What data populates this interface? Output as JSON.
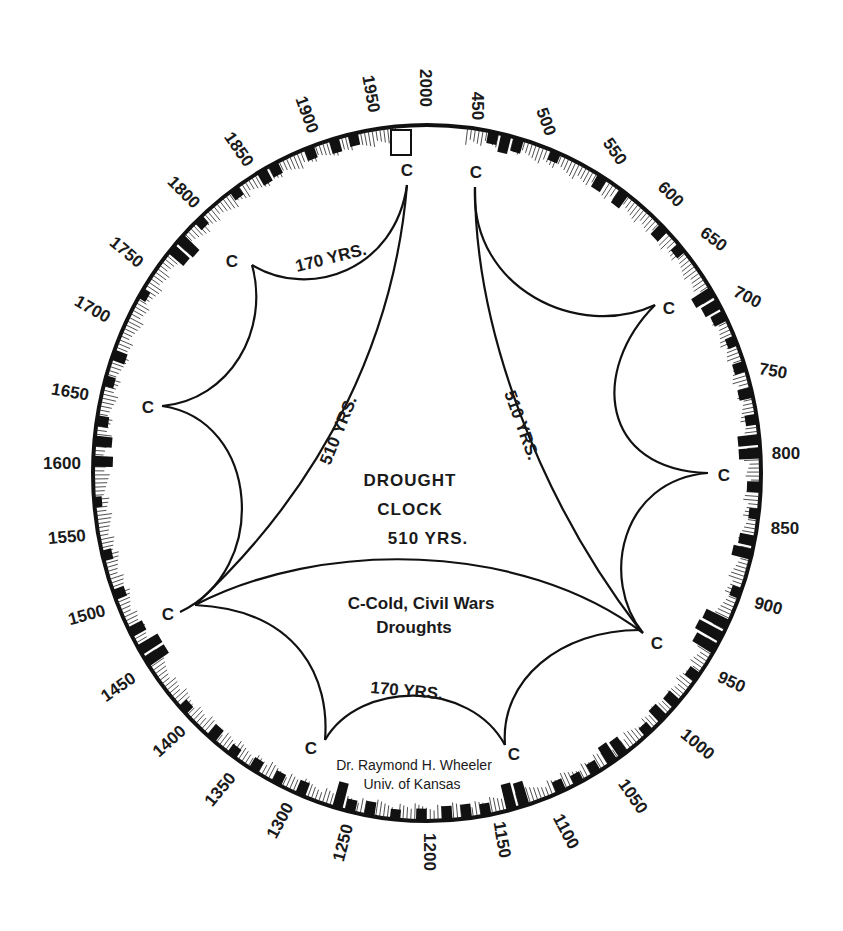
{
  "title": {
    "line1": "DROUGHT",
    "line2": "CLOCK",
    "line3": "510 YRS."
  },
  "legend": {
    "line1": "C-Cold, Civil Wars",
    "line2": "Droughts"
  },
  "credit": {
    "line1": "Dr. Raymond H. Wheeler",
    "line2": "Univ. of Kansas"
  },
  "cycle_labels": {
    "top_left_170": "170 YRS.",
    "bottom_170": "170 YRS.",
    "left_510": "510 YRS.",
    "right_510": "510 YRS."
  },
  "cusp_marker": "C",
  "cusps": [
    {
      "id": "c-top-left",
      "x": 407,
      "y": 185,
      "lx": 407,
      "ly": 172
    },
    {
      "id": "c-top-right",
      "x": 475,
      "y": 187,
      "lx": 476,
      "ly": 174
    },
    {
      "id": "c-upper-left",
      "x": 252,
      "y": 265,
      "lx": 232,
      "ly": 263
    },
    {
      "id": "c-left",
      "x": 162,
      "y": 406,
      "lx": 148,
      "ly": 409
    },
    {
      "id": "c-lower-left",
      "x": 180,
      "y": 612,
      "lx": 168,
      "ly": 616
    },
    {
      "id": "c-bottom-left",
      "x": 325,
      "y": 740,
      "lx": 311,
      "ly": 750
    },
    {
      "id": "c-bottom-right",
      "x": 505,
      "y": 745,
      "lx": 514,
      "ly": 756
    },
    {
      "id": "c-lower-right",
      "x": 643,
      "y": 633,
      "lx": 657,
      "ly": 645
    },
    {
      "id": "c-right",
      "x": 708,
      "y": 473,
      "lx": 724,
      "ly": 477
    },
    {
      "id": "c-upper-right",
      "x": 655,
      "y": 305,
      "lx": 669,
      "ly": 310
    }
  ],
  "ring": {
    "center_x": 427,
    "center_y": 473,
    "radius_x": 334,
    "radius_y": 348,
    "start_year_at_top_right": 450,
    "end_year_at_top_left": 2000,
    "gap_marker_year_range": [
      1985,
      2000
    ]
  },
  "year_ticks": [
    {
      "label": "450",
      "x": 476,
      "y": 106,
      "rot": 90
    },
    {
      "label": "500",
      "x": 545,
      "y": 122,
      "rot": 70
    },
    {
      "label": "550",
      "x": 614,
      "y": 152,
      "rot": 55
    },
    {
      "label": "600",
      "x": 670,
      "y": 195,
      "rot": 45
    },
    {
      "label": "650",
      "x": 713,
      "y": 240,
      "rot": 37
    },
    {
      "label": "700",
      "x": 747,
      "y": 298,
      "rot": 27
    },
    {
      "label": "750",
      "x": 773,
      "y": 372,
      "rot": 10
    },
    {
      "label": "800",
      "x": 786,
      "y": 455,
      "rot": 0
    },
    {
      "label": "850",
      "x": 785,
      "y": 530,
      "rot": 0
    },
    {
      "label": "900",
      "x": 768,
      "y": 607,
      "rot": 15
    },
    {
      "label": "950",
      "x": 731,
      "y": 683,
      "rot": 25
    },
    {
      "label": "1000",
      "x": 697,
      "y": 745,
      "rot": 40
    },
    {
      "label": "1050",
      "x": 632,
      "y": 797,
      "rot": 55
    },
    {
      "label": "1100",
      "x": 565,
      "y": 832,
      "rot": 62
    },
    {
      "label": "1150",
      "x": 501,
      "y": 840,
      "rot": 80
    },
    {
      "label": "1200",
      "x": 428,
      "y": 852,
      "rot": 90
    },
    {
      "label": "1250",
      "x": 344,
      "y": 843,
      "rot": -75
    },
    {
      "label": "1300",
      "x": 281,
      "y": 821,
      "rot": -62
    },
    {
      "label": "1350",
      "x": 221,
      "y": 790,
      "rot": -50
    },
    {
      "label": "1400",
      "x": 170,
      "y": 742,
      "rot": -42
    },
    {
      "label": "1450",
      "x": 119,
      "y": 688,
      "rot": -35
    },
    {
      "label": "1500",
      "x": 87,
      "y": 616,
      "rot": -15
    },
    {
      "label": "1550",
      "x": 67,
      "y": 538,
      "rot": -5
    },
    {
      "label": "1600",
      "x": 62,
      "y": 465,
      "rot": 0
    },
    {
      "label": "1650",
      "x": 70,
      "y": 393,
      "rot": 10
    },
    {
      "label": "1700",
      "x": 92,
      "y": 310,
      "rot": 30
    },
    {
      "label": "1750",
      "x": 126,
      "y": 253,
      "rot": 40
    },
    {
      "label": "1800",
      "x": 183,
      "y": 193,
      "rot": 45
    },
    {
      "label": "1850",
      "x": 238,
      "y": 150,
      "rot": 55
    },
    {
      "label": "1900",
      "x": 306,
      "y": 115,
      "rot": 70
    },
    {
      "label": "1950",
      "x": 370,
      "y": 94,
      "rot": 80
    },
    {
      "label": "2000",
      "x": 424,
      "y": 88,
      "rot": 90
    }
  ],
  "drought_bars": [
    {
      "year": 470,
      "h": 12
    },
    {
      "year": 480,
      "h": 18
    },
    {
      "year": 490,
      "h": 14
    },
    {
      "year": 520,
      "h": 10
    },
    {
      "year": 560,
      "h": 14
    },
    {
      "year": 580,
      "h": 16
    },
    {
      "year": 620,
      "h": 14
    },
    {
      "year": 640,
      "h": 10
    },
    {
      "year": 680,
      "h": 22
    },
    {
      "year": 690,
      "h": 18
    },
    {
      "year": 700,
      "h": 14
    },
    {
      "year": 720,
      "h": 10
    },
    {
      "year": 740,
      "h": 12
    },
    {
      "year": 760,
      "h": 14
    },
    {
      "year": 780,
      "h": 12
    },
    {
      "year": 795,
      "h": 22
    },
    {
      "year": 805,
      "h": 22
    },
    {
      "year": 830,
      "h": 14
    },
    {
      "year": 850,
      "h": 10
    },
    {
      "year": 870,
      "h": 16
    },
    {
      "year": 880,
      "h": 20
    },
    {
      "year": 910,
      "h": 10
    },
    {
      "year": 935,
      "h": 26
    },
    {
      "year": 945,
      "h": 28
    },
    {
      "year": 955,
      "h": 24
    },
    {
      "year": 980,
      "h": 12
    },
    {
      "year": 1005,
      "h": 14
    },
    {
      "year": 1020,
      "h": 16
    },
    {
      "year": 1035,
      "h": 10
    },
    {
      "year": 1060,
      "h": 18
    },
    {
      "year": 1070,
      "h": 20
    },
    {
      "year": 1085,
      "h": 12
    },
    {
      "year": 1100,
      "h": 10
    },
    {
      "year": 1115,
      "h": 12
    },
    {
      "year": 1145,
      "h": 24
    },
    {
      "year": 1155,
      "h": 26
    },
    {
      "year": 1175,
      "h": 12
    },
    {
      "year": 1190,
      "h": 14
    },
    {
      "year": 1205,
      "h": 14
    },
    {
      "year": 1225,
      "h": 12
    },
    {
      "year": 1245,
      "h": 10
    },
    {
      "year": 1265,
      "h": 14
    },
    {
      "year": 1280,
      "h": 12
    },
    {
      "year": 1290,
      "h": 26
    },
    {
      "year": 1320,
      "h": 14
    },
    {
      "year": 1340,
      "h": 12
    },
    {
      "year": 1360,
      "h": 12
    },
    {
      "year": 1380,
      "h": 10
    },
    {
      "year": 1400,
      "h": 14
    },
    {
      "year": 1430,
      "h": 10
    },
    {
      "year": 1475,
      "h": 24
    },
    {
      "year": 1485,
      "h": 24
    },
    {
      "year": 1500,
      "h": 16
    },
    {
      "year": 1530,
      "h": 12
    },
    {
      "year": 1560,
      "h": 10
    },
    {
      "year": 1600,
      "h": 8
    },
    {
      "year": 1630,
      "h": 20
    },
    {
      "year": 1645,
      "h": 18
    },
    {
      "year": 1660,
      "h": 12
    },
    {
      "year": 1690,
      "h": 10
    },
    {
      "year": 1710,
      "h": 14
    },
    {
      "year": 1760,
      "h": 8
    },
    {
      "year": 1800,
      "h": 20
    },
    {
      "year": 1810,
      "h": 22
    },
    {
      "year": 1830,
      "h": 10
    },
    {
      "year": 1865,
      "h": 10
    },
    {
      "year": 1890,
      "h": 14
    },
    {
      "year": 1900,
      "h": 12
    },
    {
      "year": 1930,
      "h": 12
    },
    {
      "year": 1950,
      "h": 14
    },
    {
      "year": 1965,
      "h": 12
    }
  ],
  "colors": {
    "ink": "#111111",
    "paper": "#ffffff"
  }
}
